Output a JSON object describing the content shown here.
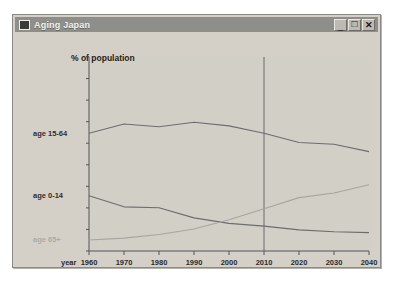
{
  "window": {
    "title": "Aging Japan",
    "icon": "window-app-icon",
    "buttons": [
      {
        "name": "minimize",
        "glyph": "_"
      },
      {
        "name": "maximize",
        "glyph": "□"
      },
      {
        "name": "close",
        "glyph": "✕"
      }
    ]
  },
  "chart_data": {
    "type": "line",
    "title": "% of population",
    "xlabel": "year",
    "ylabel": "",
    "x": [
      1960,
      1970,
      1980,
      1990,
      2000,
      2010,
      2020,
      2030,
      2040
    ],
    "categories": [
      "1960",
      "1970",
      "1980",
      "1990",
      "2000",
      "2010",
      "2020",
      "2030",
      "2040"
    ],
    "xlim": [
      1960,
      2040
    ],
    "ylim": [
      0,
      100
    ],
    "grid": false,
    "legend_position": "left-inline",
    "y_ticks_labeled": false,
    "annotations": [
      {
        "type": "vertical-line",
        "x": 2010,
        "style": "thin-solid"
      }
    ],
    "series": [
      {
        "name": "age 15-64",
        "color": "#6d6d6f",
        "label_x": 1960,
        "values": [
          64,
          69,
          67.5,
          70,
          68,
          64,
          59,
          58,
          54
        ]
      },
      {
        "name": "age 0-14",
        "color": "#6d6d6f",
        "label_x": 1960,
        "values": [
          30,
          24,
          23.5,
          18,
          15,
          13.5,
          11.5,
          10.5,
          10
        ]
      },
      {
        "name": "age 65+",
        "color": "#a8a5a0",
        "label_x": 1960,
        "values": [
          6,
          7,
          9,
          12,
          17,
          23,
          29,
          31.5,
          36
        ]
      }
    ]
  }
}
